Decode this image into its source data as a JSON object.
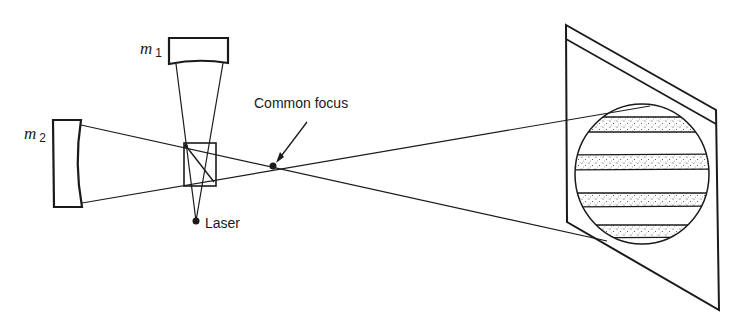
{
  "diagram": {
    "type": "optical-setup",
    "labels": {
      "mirror1": "m",
      "mirror1_sub": "1",
      "mirror2": "m",
      "mirror2_sub": "2",
      "laser": "Laser",
      "focus": "Common focus"
    },
    "components": [
      "mirror-m1",
      "mirror-m2",
      "beam-splitter",
      "laser",
      "common-focus",
      "screen"
    ],
    "fringe_bands": 4,
    "colors": {
      "ink": "#1a1a1a",
      "background": "#ffffff"
    }
  }
}
